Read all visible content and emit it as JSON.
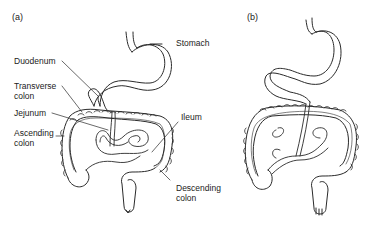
{
  "panels": [
    {
      "id": "a",
      "label": "(a)",
      "annotations": [
        {
          "text": "Duodenum",
          "target": "duodenum"
        },
        {
          "text": "Transverse colon",
          "line1": "Transverse",
          "line2": "colon",
          "target": "transverse-colon"
        },
        {
          "text": "Jejunum",
          "target": "jejunum"
        },
        {
          "text": "Ascending colon",
          "line1": "Ascending",
          "line2": "colon",
          "target": "ascending-colon"
        },
        {
          "text": "Stomach",
          "target": "stomach"
        },
        {
          "text": "Ileum",
          "target": "ileum"
        },
        {
          "text": "Descending colon",
          "line1": "Descending",
          "line2": "colon",
          "target": "descending-colon"
        }
      ]
    },
    {
      "id": "b",
      "label": "(b)",
      "annotations": []
    }
  ],
  "colors": {
    "background": "#ffffff",
    "stroke": "#2a2a2a",
    "text": "#222222"
  }
}
